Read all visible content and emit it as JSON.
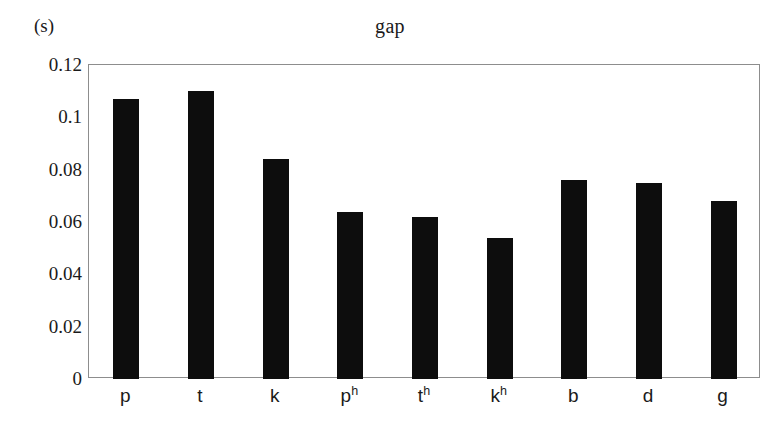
{
  "chart_data": {
    "type": "bar",
    "title": "gap",
    "unit_label": "(s)",
    "xlabel": "",
    "ylabel": "",
    "categories": [
      "p",
      "t",
      "k",
      "pʰ",
      "tʰ",
      "kʰ",
      "b",
      "d",
      "g"
    ],
    "category_parts": [
      {
        "base": "p",
        "sup": ""
      },
      {
        "base": "t",
        "sup": ""
      },
      {
        "base": "k",
        "sup": ""
      },
      {
        "base": "p",
        "sup": "h"
      },
      {
        "base": "t",
        "sup": "h"
      },
      {
        "base": "k",
        "sup": "h"
      },
      {
        "base": "b",
        "sup": ""
      },
      {
        "base": "d",
        "sup": ""
      },
      {
        "base": "g",
        "sup": ""
      }
    ],
    "values": [
      0.107,
      0.11,
      0.084,
      0.064,
      0.062,
      0.054,
      0.076,
      0.075,
      0.068
    ],
    "ylim": [
      0,
      0.12
    ],
    "yticks": [
      0,
      0.02,
      0.04,
      0.06,
      0.08,
      0.1,
      0.12
    ],
    "ytick_labels": [
      "0",
      "0.02",
      "0.04",
      "0.06",
      "0.08",
      "0.1",
      "0.12"
    ],
    "grid": false,
    "legend": null,
    "bar_color": "#0d0d0d",
    "frame_color": "#8d8d8d",
    "background_color": "#ffffff"
  }
}
